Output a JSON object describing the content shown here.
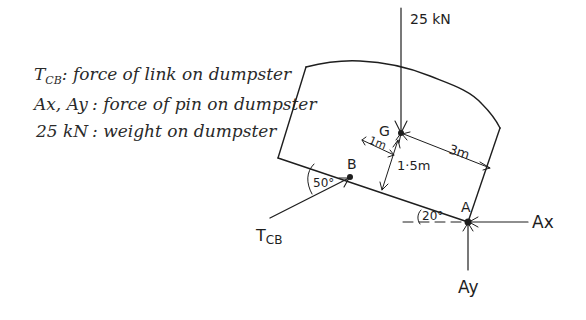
{
  "legend": [
    {
      "symbol": "T",
      "subscript": "CB",
      "description": ": force of link on dumpster"
    },
    {
      "symbol": "Ax, Ay",
      "subscript": "",
      "description": ": force of pin on dumpster"
    },
    {
      "symbol": "25 kN",
      "subscript": "",
      "description": ": weight on dumpster"
    }
  ],
  "labels": {
    "weight": "25 kN",
    "point_g": "G",
    "point_b": "B",
    "point_a": "A",
    "dim_1m": "1m",
    "dim_3m": "3m",
    "dim_1_5m": "1·5m",
    "angle_50": "50°",
    "angle_20": "20°",
    "force_ax": "Ax",
    "force_ay": "Ay",
    "force_tcb_main": "T",
    "force_tcb_sub": "CB"
  }
}
